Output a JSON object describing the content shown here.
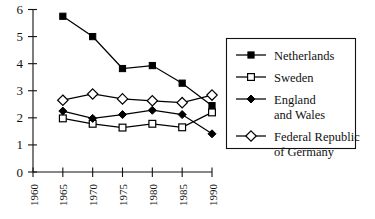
{
  "chart_data": {
    "type": "line",
    "title": "",
    "subtitle": "",
    "xlabel": "",
    "ylabel": "",
    "xlim": [
      1960,
      1990
    ],
    "ylim": [
      0,
      6
    ],
    "grid": false,
    "legend_position": "right",
    "x": [
      1965,
      1970,
      1975,
      1980,
      1985,
      1990
    ],
    "xticks": [
      "1960",
      "1965",
      "1970",
      "1975",
      "1980",
      "1985",
      "1990"
    ],
    "xtick_values": [
      1960,
      1965,
      1970,
      1975,
      1980,
      1985,
      1990
    ],
    "yticks": [
      "0",
      "1",
      "2",
      "3",
      "4",
      "5",
      "6"
    ],
    "ytick_values": [
      0,
      1,
      2,
      3,
      4,
      5,
      6
    ],
    "series": [
      {
        "name": "Netherlands",
        "marker": "filled-square",
        "values": [
          5.75,
          5.0,
          3.82,
          3.93,
          3.28,
          2.45
        ]
      },
      {
        "name": "Sweden",
        "marker": "open-square",
        "values": [
          1.98,
          1.78,
          1.64,
          1.78,
          1.65,
          2.2
        ]
      },
      {
        "name": "England and Wales",
        "marker": "filled-diamond",
        "values": [
          2.25,
          1.98,
          2.12,
          2.28,
          2.12,
          1.41
        ]
      },
      {
        "name": "Federal Republic of Germany",
        "marker": "open-diamond",
        "values": [
          2.65,
          2.88,
          2.7,
          2.63,
          2.56,
          2.84
        ]
      }
    ]
  },
  "legend": {
    "entries": [
      {
        "label": "Netherlands",
        "label_line2": "",
        "marker": "filled-square"
      },
      {
        "label": "Sweden",
        "label_line2": "",
        "marker": "open-square"
      },
      {
        "label": "England",
        "label_line2": "and Wales",
        "marker": "filled-diamond"
      },
      {
        "label": "Federal Republic",
        "label_line2": "of Germany",
        "marker": "open-diamond"
      }
    ]
  }
}
